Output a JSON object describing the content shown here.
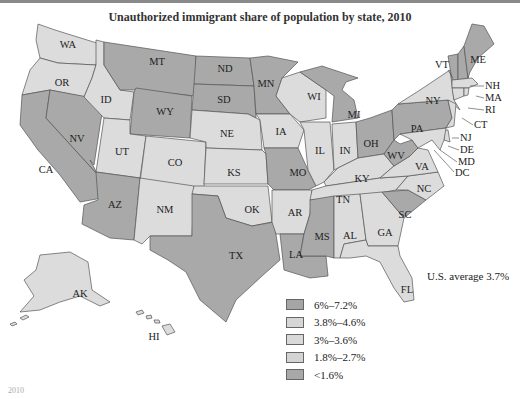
{
  "title": "Unauthorized immigrant share of population by state, 2010",
  "us_average": "U.S. average 3.7%",
  "colors": {
    "dark": "#a9a9a9",
    "light": "#dcdcdc",
    "outline": "#555555"
  },
  "legend": [
    {
      "label": "6%–7.2%",
      "color": "#a5a5a5"
    },
    {
      "label": "3.8%–4.6%",
      "color": "#d6d6d6"
    },
    {
      "label": "3%–3.6%",
      "color": "#d9d9d9"
    },
    {
      "label": "1.8%–2.7%",
      "color": "#d3d3d3"
    },
    {
      "label": "<1.6%",
      "color": "#a8a8a8"
    }
  ],
  "states": {
    "WA": "WA",
    "OR": "OR",
    "CA": "CA",
    "NV": "NV",
    "ID": "ID",
    "MT": "MT",
    "WY": "WY",
    "UT": "UT",
    "CO": "CO",
    "AZ": "AZ",
    "NM": "NM",
    "ND": "ND",
    "SD": "SD",
    "NE": "NE",
    "KS": "KS",
    "OK": "OK",
    "TX": "TX",
    "MN": "MN",
    "IA": "IA",
    "MO": "MO",
    "AR": "AR",
    "LA": "LA",
    "WI": "WI",
    "IL": "IL",
    "MI": "MI",
    "IN": "IN",
    "OH": "OH",
    "KY": "KY",
    "TN": "TN",
    "MS": "MS",
    "AL": "AL",
    "GA": "GA",
    "FL": "FL",
    "SC": "SC",
    "NC": "NC",
    "VA": "VA",
    "WV": "WV",
    "PA": "PA",
    "NY": "NY",
    "VT": "VT",
    "NH": "NH",
    "ME": "ME",
    "MA": "MA",
    "RI": "RI",
    "CT": "CT",
    "NJ": "NJ",
    "DE": "DE",
    "MD": "MD",
    "DC": "DC",
    "AK": "AK",
    "HI": "HI"
  },
  "footnote": "2010"
}
